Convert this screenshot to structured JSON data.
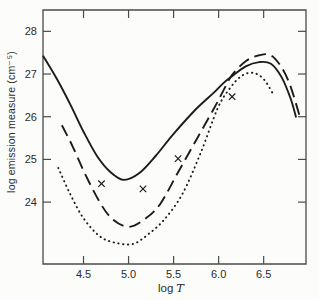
{
  "figure": {
    "background": "#fcfcfa",
    "axis_color": "#4a4a4a",
    "curve_color": "#1c1c1c",
    "text_color": "#2b2b2b"
  },
  "chart_data": {
    "type": "line",
    "title": "",
    "xlabel": "log T",
    "xlabel_parts": {
      "prefix": "log",
      "variable": "T"
    },
    "ylabel": "log emission measure (cm⁻⁵)",
    "xlim": [
      4.05,
      6.97
    ],
    "ylim": [
      22.55,
      28.5
    ],
    "grid": false,
    "legend": "none",
    "xticks": [
      {
        "value": 4.5,
        "label": "4.5"
      },
      {
        "value": 5.0,
        "label": "5.0"
      },
      {
        "value": 5.5,
        "label": "5.5"
      },
      {
        "value": 6.0,
        "label": "6.0"
      },
      {
        "value": 6.5,
        "label": "6.5"
      }
    ],
    "yticks": [
      {
        "value": 24,
        "label": "24"
      },
      {
        "value": 25,
        "label": "25"
      },
      {
        "value": 26,
        "label": "26"
      },
      {
        "value": 27,
        "label": "27"
      },
      {
        "value": 28,
        "label": "28"
      }
    ],
    "series": [
      {
        "name": "dotted",
        "style": "dotted",
        "points": [
          [
            4.22,
            24.8
          ],
          [
            4.35,
            24.2
          ],
          [
            4.5,
            23.62
          ],
          [
            4.68,
            23.2
          ],
          [
            4.85,
            23.05
          ],
          [
            5.05,
            23.02
          ],
          [
            5.22,
            23.25
          ],
          [
            5.4,
            23.6
          ],
          [
            5.6,
            24.2
          ],
          [
            5.8,
            25.15
          ],
          [
            5.99,
            26.2
          ],
          [
            6.12,
            26.65
          ],
          [
            6.25,
            26.95
          ],
          [
            6.38,
            27.03
          ],
          [
            6.5,
            26.88
          ],
          [
            6.6,
            26.55
          ]
        ]
      },
      {
        "name": "long-dashed",
        "style": "long-dashed",
        "points": [
          [
            4.26,
            25.8
          ],
          [
            4.38,
            25.3
          ],
          [
            4.52,
            24.65
          ],
          [
            4.68,
            24.0
          ],
          [
            4.82,
            23.6
          ],
          [
            5.0,
            23.42
          ],
          [
            5.18,
            23.6
          ],
          [
            5.35,
            23.95
          ],
          [
            5.55,
            24.7
          ],
          [
            5.75,
            25.45
          ],
          [
            5.95,
            26.2
          ],
          [
            6.05,
            26.6
          ],
          [
            6.15,
            26.98
          ],
          [
            6.3,
            27.3
          ],
          [
            6.45,
            27.44
          ],
          [
            6.58,
            27.44
          ],
          [
            6.7,
            27.15
          ],
          [
            6.8,
            26.7
          ],
          [
            6.91,
            25.94
          ]
        ]
      },
      {
        "name": "solid",
        "style": "solid",
        "points": [
          [
            4.05,
            27.43
          ],
          [
            4.2,
            26.9
          ],
          [
            4.35,
            26.3
          ],
          [
            4.5,
            25.65
          ],
          [
            4.65,
            25.08
          ],
          [
            4.8,
            24.7
          ],
          [
            4.95,
            24.52
          ],
          [
            5.12,
            24.68
          ],
          [
            5.3,
            25.08
          ],
          [
            5.5,
            25.6
          ],
          [
            5.75,
            26.18
          ],
          [
            5.95,
            26.57
          ],
          [
            6.05,
            26.78
          ],
          [
            6.15,
            26.95
          ],
          [
            6.3,
            27.18
          ],
          [
            6.45,
            27.28
          ],
          [
            6.58,
            27.24
          ],
          [
            6.7,
            26.92
          ],
          [
            6.8,
            26.42
          ],
          [
            6.86,
            25.98
          ]
        ]
      }
    ],
    "markers": {
      "symbol": "x",
      "points": [
        [
          4.7,
          24.43
        ],
        [
          5.16,
          24.31
        ],
        [
          5.55,
          25.02
        ],
        [
          6.15,
          26.47
        ]
      ]
    }
  }
}
